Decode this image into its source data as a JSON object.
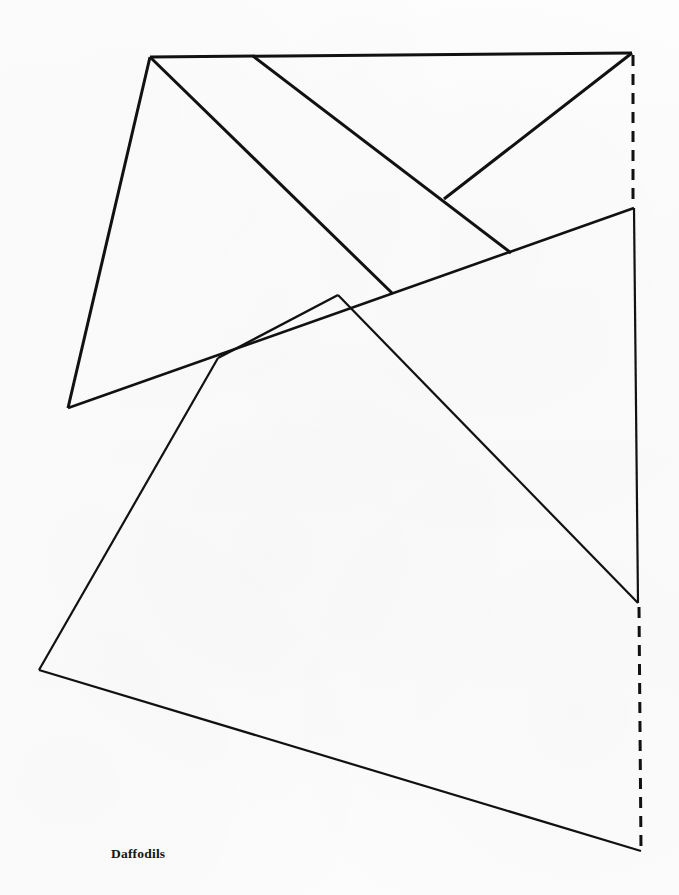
{
  "document": {
    "type": "technical-line-drawing",
    "subject": "garment pattern piece",
    "background_color": "#fbfbfb",
    "ink_color": "#111111",
    "width": 679,
    "height": 895
  },
  "labels": [
    {
      "id": "pattern-name",
      "text": "Daffodils",
      "x": 111,
      "y": 846,
      "font_weight": "bold",
      "font_style": "serif",
      "font_size_px": 13.5
    }
  ],
  "geometry": {
    "vertices": {
      "top_left": [
        150,
        57
      ],
      "top_mid_branch": [
        253,
        56
      ],
      "top_right": [
        632,
        53
      ],
      "right_upper_notch": [
        634,
        208
      ],
      "v_junction_upper": [
        444,
        199
      ],
      "diagonal_end_mid": [
        511,
        253
      ],
      "left_upper": [
        68,
        408
      ],
      "center_pinch": [
        218,
        358
      ],
      "crossing_point": [
        338,
        295
      ],
      "crossing_point_b": [
        392,
        293
      ],
      "right_lower_notch": [
        638,
        603
      ],
      "bottom_left": [
        39,
        670
      ],
      "bottom_right": [
        641,
        851
      ]
    },
    "solid_lines": [
      {
        "name": "top-edge",
        "from": [
          150,
          57
        ],
        "to": [
          632,
          53
        ],
        "width": 3.0
      },
      {
        "name": "upper-left-edge",
        "from": [
          150,
          57
        ],
        "to": [
          68,
          408
        ],
        "width": 3.0
      },
      {
        "name": "upper-left-diagonal",
        "from": [
          150,
          57
        ],
        "to": [
          392,
          293
        ],
        "width": 3.0
      },
      {
        "name": "top-branch-diagonal",
        "from": [
          253,
          56
        ],
        "to": [
          511,
          253
        ],
        "width": 3.0
      },
      {
        "name": "top-right-diagonal",
        "from": [
          632,
          53
        ],
        "to": [
          444,
          199
        ],
        "width": 3.0
      },
      {
        "name": "long-upper-chord",
        "from": [
          68,
          408
        ],
        "to": [
          634,
          208
        ],
        "width": 2.6
      },
      {
        "name": "pinch-chord",
        "from": [
          218,
          358
        ],
        "to": [
          338,
          295
        ],
        "width": 2.4
      },
      {
        "name": "right-vertical",
        "from": [
          634,
          208
        ],
        "to": [
          638,
          603
        ],
        "width": 2.2
      },
      {
        "name": "center-long-diagonal",
        "from": [
          338,
          295
        ],
        "to": [
          638,
          603
        ],
        "width": 2.2
      },
      {
        "name": "left-lower-edge",
        "from": [
          218,
          358
        ],
        "to": [
          39,
          670
        ],
        "width": 2.2
      },
      {
        "name": "bottom-edge",
        "from": [
          39,
          670
        ],
        "to": [
          641,
          851
        ],
        "width": 2.2
      }
    ],
    "dashed_lines": [
      {
        "name": "upper-fold-line",
        "from": [
          633,
          55
        ],
        "to": [
          633,
          207
        ],
        "width": 3.0,
        "dash": "11 8"
      },
      {
        "name": "lower-fold-line",
        "from": [
          639,
          607
        ],
        "to": [
          641,
          849
        ],
        "width": 3.0,
        "dash": "11 8"
      }
    ]
  }
}
